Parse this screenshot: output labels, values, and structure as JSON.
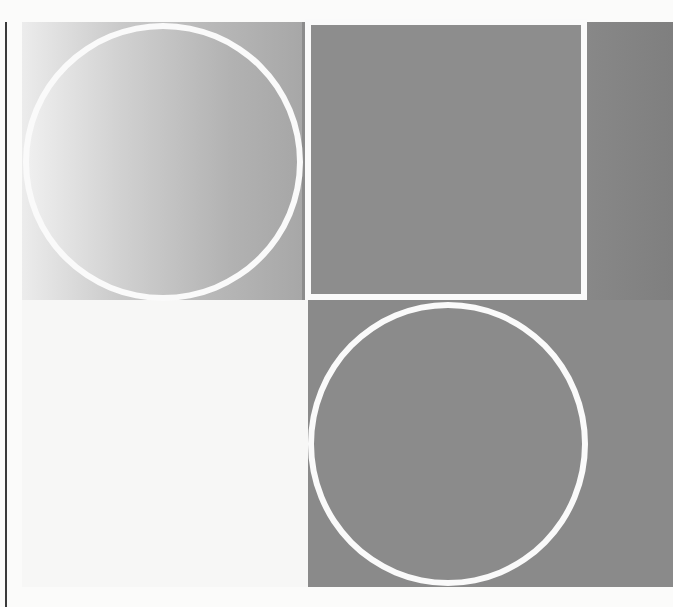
{
  "artwork": {
    "description": "Scanned page of an abstract geometric composition: two white-outlined circles and a white-outlined square on gray fields",
    "colors": {
      "paper": "#fbfbfa",
      "outline": "#fafafa",
      "dark_gray": "#8a8a8a",
      "gradient_light": "#ececec",
      "gradient_dark": "#a6a6a6",
      "margin_rule": "#3a3a3a"
    },
    "shapes": [
      {
        "type": "circle",
        "position": "top-left",
        "fill": "horizontal gradient light-to-gray",
        "stroke": "white"
      },
      {
        "type": "square",
        "position": "top-center",
        "fill": "dark gray",
        "stroke": "white"
      },
      {
        "type": "circle",
        "position": "bottom-center",
        "fill": "dark gray",
        "stroke": "white"
      }
    ]
  }
}
